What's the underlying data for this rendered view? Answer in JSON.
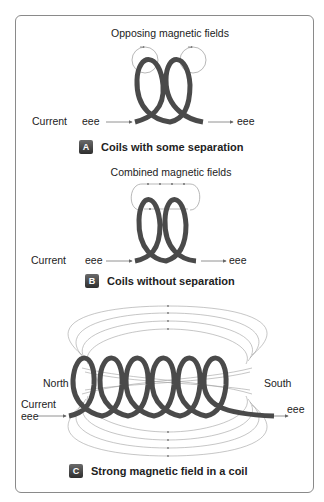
{
  "panels": [
    {
      "id": "A",
      "title": "Opposing magnetic fields",
      "current_label": "Current",
      "electron_in": "eee",
      "electron_out": "eee",
      "caption": "Coils with some separation"
    },
    {
      "id": "B",
      "title": "Combined magnetic fields",
      "current_label": "Current",
      "electron_in": "eee",
      "electron_out": "eee",
      "caption": "Coils without separation"
    },
    {
      "id": "C",
      "pole_left": "North",
      "pole_right": "South",
      "current_label": "Current",
      "electron_in": "eee",
      "electron_out": "eee",
      "caption": "Strong magnetic field in a coil"
    }
  ],
  "colors": {
    "coil": "#4a4a4a",
    "field_line": "#9a9a9a",
    "badge": "#3a3a3a",
    "border": "#8a8a8a"
  }
}
